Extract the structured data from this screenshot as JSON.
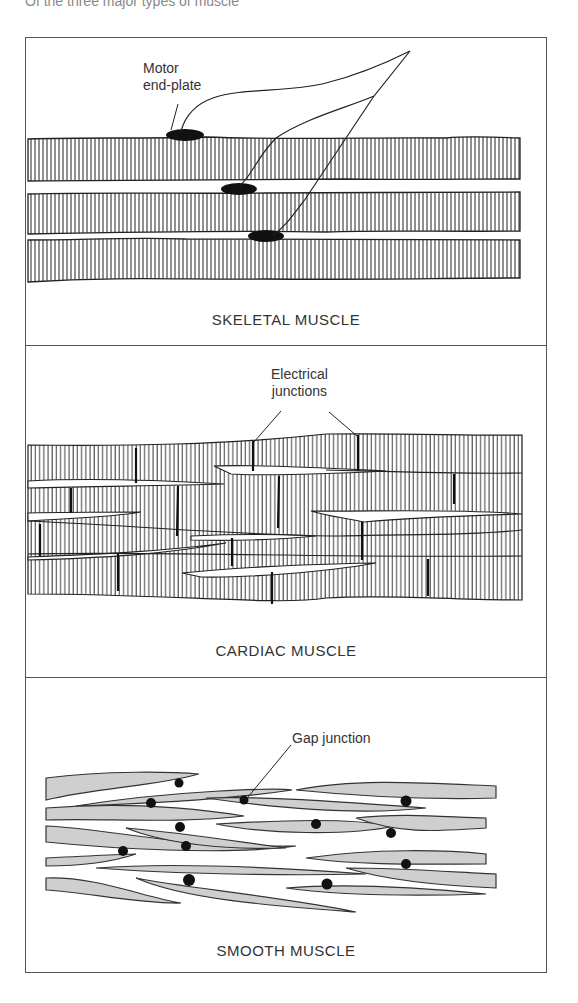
{
  "figure": {
    "top_caption_fragment": "Of the three major types of muscle",
    "panels": [
      {
        "id": "skeletal",
        "title": "SKELETAL MUSCLE",
        "labels": [
          {
            "text_line1": "Motor",
            "text_line2": "end-plate"
          }
        ]
      },
      {
        "id": "cardiac",
        "title": "CARDIAC MUSCLE",
        "labels": [
          {
            "text_line1": "Electrical",
            "text_line2": "junctions"
          }
        ]
      },
      {
        "id": "smooth",
        "title": "SMOOTH MUSCLE",
        "labels": [
          {
            "text_line1": "Gap junction"
          }
        ]
      }
    ],
    "colors": {
      "line": "#222222",
      "fiber_fill_smooth": "#cfcfcf",
      "junction": "#111111",
      "border": "#555555"
    }
  }
}
